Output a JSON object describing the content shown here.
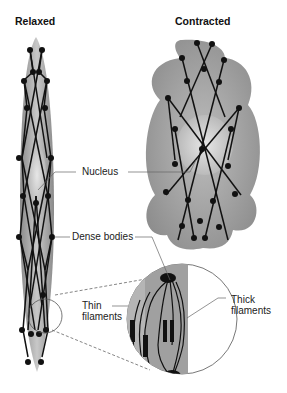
{
  "titles": {
    "relaxed": "Relaxed",
    "contracted": "Contracted"
  },
  "labels": {
    "nucleus": "Nucleus",
    "dense_bodies": "Dense bodies",
    "thin_filaments_line1": "Thin",
    "thin_filaments_line2": "filaments",
    "thick_filaments_line1": "Thick",
    "thick_filaments_line2": "filaments"
  },
  "colors": {
    "cell_fill": "#9a9a9a",
    "nucleus_fill": "#d8d8d8",
    "filament": "#111111",
    "leader_line": "#666666"
  }
}
